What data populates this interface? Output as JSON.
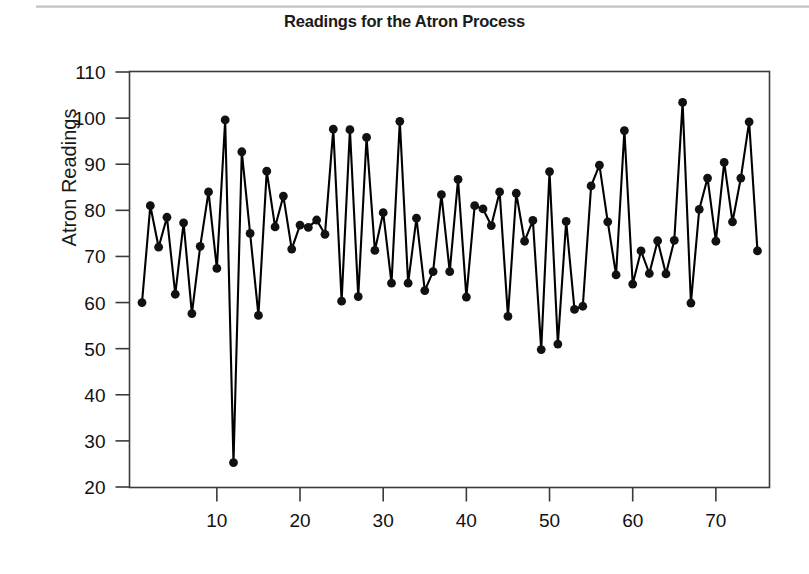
{
  "chart_data": {
    "type": "line",
    "title": "Readings for the Atron Process",
    "xlabel": "",
    "ylabel": "Atron Readings",
    "xlim": [
      1,
      75
    ],
    "ylim": [
      20,
      110
    ],
    "grid": false,
    "legend": false,
    "marker": "filled-circle",
    "line_color": "#000000",
    "marker_color": "#111111",
    "y_ticks": [
      20,
      30,
      40,
      50,
      60,
      70,
      80,
      90,
      100,
      110
    ],
    "x_ticks": [
      10,
      20,
      30,
      40,
      50,
      60,
      70
    ],
    "x": [
      1,
      2,
      3,
      4,
      5,
      6,
      7,
      8,
      9,
      10,
      11,
      12,
      13,
      14,
      15,
      16,
      17,
      18,
      19,
      20,
      21,
      22,
      23,
      24,
      25,
      26,
      27,
      28,
      29,
      30,
      31,
      32,
      33,
      34,
      35,
      36,
      37,
      38,
      39,
      40,
      41,
      42,
      43,
      44,
      45,
      46,
      47,
      48,
      49,
      50,
      51,
      52,
      53,
      54,
      55,
      56,
      57,
      58,
      59,
      60,
      61,
      62,
      63,
      64,
      65,
      66,
      67,
      68,
      69,
      70,
      71,
      72,
      73,
      74,
      75
    ],
    "values": [
      60.0,
      81.0,
      72.0,
      78.5,
      61.8,
      77.3,
      57.6,
      72.2,
      84.0,
      67.4,
      99.6,
      25.3,
      92.7,
      75.0,
      57.2,
      88.5,
      76.4,
      83.1,
      71.6,
      76.8,
      76.3,
      77.9,
      74.8,
      97.6,
      60.3,
      97.5,
      61.3,
      95.8,
      71.3,
      79.5,
      64.2,
      99.3,
      64.2,
      78.3,
      62.6,
      66.7,
      83.4,
      66.7,
      86.7,
      61.2,
      81.0,
      80.3,
      76.7,
      84.0,
      57.0,
      83.7,
      73.3,
      77.8,
      49.8,
      88.4,
      51.0,
      77.6,
      58.5,
      59.2,
      85.3,
      89.8,
      77.5,
      66.0,
      97.3,
      64.0,
      71.2,
      66.3,
      73.4,
      66.2,
      73.5,
      103.4,
      59.9,
      80.2,
      87.0,
      73.3,
      90.4,
      77.5,
      87.0,
      99.2,
      71.2
    ],
    "series": [
      {
        "name": "Atron Readings",
        "values": [
          60.0,
          81.0,
          72.0,
          78.5,
          61.8,
          77.3,
          57.6,
          72.2,
          84.0,
          67.4,
          99.6,
          25.3,
          92.7,
          75.0,
          57.2,
          88.5,
          76.4,
          83.1,
          71.6,
          76.8,
          76.3,
          77.9,
          74.8,
          97.6,
          60.3,
          97.5,
          61.3,
          95.8,
          71.3,
          79.5,
          64.2,
          99.3,
          64.2,
          78.3,
          62.6,
          66.7,
          83.4,
          66.7,
          86.7,
          61.2,
          81.0,
          80.3,
          76.7,
          84.0,
          57.0,
          83.7,
          73.3,
          77.8,
          49.8,
          88.4,
          51.0,
          77.6,
          58.5,
          59.2,
          85.3,
          89.8,
          77.5,
          66.0,
          97.3,
          64.0,
          71.2,
          66.3,
          73.4,
          66.2,
          73.5,
          103.4,
          59.9,
          80.2,
          87.0,
          73.3,
          90.4,
          77.5,
          87.0,
          99.2,
          71.2
        ]
      }
    ]
  },
  "figure": {
    "title": "Readings for the Atron Process",
    "ylabel": "Atron Readings",
    "y_tick_labels": [
      "110",
      "100",
      "90",
      "80",
      "70",
      "60",
      "50",
      "40",
      "30",
      "20"
    ],
    "x_tick_labels": [
      "10",
      "20",
      "30",
      "40",
      "50",
      "60",
      "70"
    ],
    "background": "#ffffff",
    "frame_color": "#3b3b3b"
  }
}
